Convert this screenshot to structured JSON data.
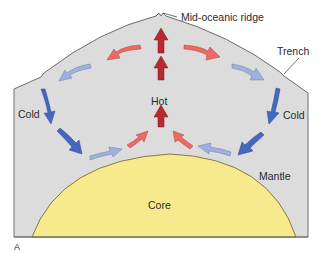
{
  "figure": {
    "panel_label": "A",
    "labels": {
      "ridge": "Mid-oceanic ridge",
      "trench": "Trench",
      "cold_left": "Cold",
      "cold_right": "Cold",
      "hot": "Hot",
      "mantle": "Mantle",
      "core": "Core"
    },
    "colors": {
      "mantle_fill": "#dcdcdc",
      "mantle_stroke": "#6e6e6e",
      "core_fill": "#f7ea8c",
      "core_stroke": "#7a6a3a",
      "hot_arrow": "#b82a2e",
      "warm_arrow": "#ec6a63",
      "cool_arrow": "#9fb0dd",
      "cold_arrow": "#4468bf"
    },
    "arrows": [
      {
        "name": "rising-arrow-top",
        "temperature": "hot"
      },
      {
        "name": "rising-arrow-middle",
        "temperature": "hot"
      },
      {
        "name": "rising-arrow-bottom",
        "temperature": "hot"
      },
      {
        "name": "spreading-arrow-left",
        "temperature": "warm"
      },
      {
        "name": "spreading-arrow-right",
        "temperature": "warm"
      },
      {
        "name": "cooling-arrow-left",
        "temperature": "cool"
      },
      {
        "name": "cooling-arrow-right",
        "temperature": "cool"
      },
      {
        "name": "sinking-arrow-left-upper",
        "temperature": "cold"
      },
      {
        "name": "sinking-arrow-left-lower",
        "temperature": "cold"
      },
      {
        "name": "sinking-arrow-right-upper",
        "temperature": "cold"
      },
      {
        "name": "sinking-arrow-right-lower",
        "temperature": "cold"
      },
      {
        "name": "return-arrow-left-cool",
        "temperature": "cool"
      },
      {
        "name": "return-arrow-left-warm",
        "temperature": "warm"
      },
      {
        "name": "return-arrow-right-cool",
        "temperature": "cool"
      },
      {
        "name": "return-arrow-right-warm",
        "temperature": "warm"
      }
    ]
  }
}
